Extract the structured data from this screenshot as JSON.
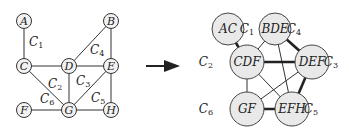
{
  "diagram": {
    "left_graph": {
      "nodes": [
        {
          "id": "A",
          "label": "A",
          "x": 24,
          "y": 21
        },
        {
          "id": "B",
          "label": "B",
          "x": 111,
          "y": 21
        },
        {
          "id": "C",
          "label": "C",
          "x": 24,
          "y": 66
        },
        {
          "id": "D",
          "label": "D",
          "x": 69,
          "y": 66
        },
        {
          "id": "E",
          "label": "E",
          "x": 111,
          "y": 66
        },
        {
          "id": "F",
          "label": "F",
          "x": 24,
          "y": 110
        },
        {
          "id": "G",
          "label": "G",
          "x": 69,
          "y": 110
        },
        {
          "id": "H",
          "label": "H",
          "x": 111,
          "y": 110
        }
      ],
      "edges": [
        [
          "A",
          "C"
        ],
        [
          "B",
          "D"
        ],
        [
          "B",
          "E"
        ],
        [
          "C",
          "D"
        ],
        [
          "D",
          "E"
        ],
        [
          "C",
          "G"
        ],
        [
          "D",
          "G"
        ],
        [
          "E",
          "G"
        ],
        [
          "E",
          "H"
        ],
        [
          "F",
          "G"
        ],
        [
          "G",
          "H"
        ]
      ],
      "clique_labels": [
        {
          "text": "C",
          "sub": "1",
          "x": 29,
          "y": 46
        },
        {
          "text": "C",
          "sub": "4",
          "x": 90,
          "y": 54
        },
        {
          "text": "C",
          "sub": "2",
          "x": 48,
          "y": 88
        },
        {
          "text": "C",
          "sub": "3",
          "x": 76,
          "y": 85
        },
        {
          "text": "C",
          "sub": "5",
          "x": 91,
          "y": 102
        },
        {
          "text": "C",
          "sub": "6",
          "x": 40,
          "y": 103
        }
      ]
    },
    "arrow": {
      "x1": 146,
      "y1": 66,
      "x2": 178,
      "y2": 66
    },
    "right_graph": {
      "nodes": [
        {
          "id": "AC",
          "label": "AC",
          "x": 228,
          "y": 29,
          "r": 16,
          "clique": "C",
          "clique_sub": "1",
          "cx": 247,
          "cy": 33
        },
        {
          "id": "BDE",
          "label": "BDE",
          "x": 275,
          "y": 29,
          "r": 16,
          "clique": "C",
          "clique_sub": "4",
          "cx": 294,
          "cy": 33
        },
        {
          "id": "CDF",
          "label": "CDF",
          "x": 247,
          "y": 62,
          "r": 17,
          "clique": "C",
          "clique_sub": "2",
          "cx": 206,
          "cy": 66
        },
        {
          "id": "DEF",
          "label": "DEF",
          "x": 312,
          "y": 62,
          "r": 17,
          "clique": "C",
          "clique_sub": "3",
          "cx": 331,
          "cy": 66
        },
        {
          "id": "GF",
          "label": "GF",
          "x": 247,
          "y": 109,
          "r": 17,
          "clique": "C",
          "clique_sub": "6",
          "cx": 206,
          "cy": 113
        },
        {
          "id": "EFH",
          "label": "EFH",
          "x": 292,
          "y": 109,
          "r": 17,
          "clique": "C",
          "clique_sub": "5",
          "cx": 311,
          "cy": 113
        }
      ],
      "edges": [
        {
          "from": "AC",
          "to": "CDF",
          "weight": "thick"
        },
        {
          "from": "BDE",
          "to": "CDF",
          "weight": "thin"
        },
        {
          "from": "BDE",
          "to": "DEF",
          "weight": "thick"
        },
        {
          "from": "BDE",
          "to": "EFH",
          "weight": "thin"
        },
        {
          "from": "CDF",
          "to": "DEF",
          "weight": "thick"
        },
        {
          "from": "CDF",
          "to": "GF",
          "weight": "thin"
        },
        {
          "from": "CDF",
          "to": "EFH",
          "weight": "thin"
        },
        {
          "from": "DEF",
          "to": "GF",
          "weight": "thin"
        },
        {
          "from": "DEF",
          "to": "EFH",
          "weight": "thick"
        },
        {
          "from": "GF",
          "to": "EFH",
          "weight": "thick"
        }
      ]
    }
  }
}
